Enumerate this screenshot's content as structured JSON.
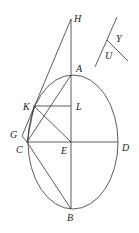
{
  "diagram": {
    "type": "geometry-ellipse-construction",
    "ellipse": {
      "cx": 73,
      "cy": 142,
      "rx": 45,
      "ry": 67
    },
    "points": {
      "H": {
        "x": 71,
        "y": 19,
        "lx": 74,
        "ly": 22,
        "label": "H"
      },
      "A": {
        "x": 71,
        "y": 75,
        "lx": 76,
        "ly": 72,
        "label": "A"
      },
      "K": {
        "x": 34,
        "y": 106,
        "lx": 23,
        "ly": 110,
        "label": "K"
      },
      "L": {
        "x": 71,
        "y": 106,
        "lx": 76,
        "ly": 110,
        "label": "L"
      },
      "G": {
        "x": 22,
        "y": 136,
        "lx": 10,
        "ly": 138,
        "label": "G"
      },
      "C": {
        "x": 27,
        "y": 142,
        "lx": 16,
        "ly": 153,
        "label": "C"
      },
      "E": {
        "x": 71,
        "y": 142,
        "lx": 61,
        "ly": 154,
        "label": "E"
      },
      "D": {
        "x": 118,
        "y": 142,
        "lx": 122,
        "ly": 151,
        "label": "D"
      },
      "B": {
        "x": 71,
        "y": 209,
        "lx": 67,
        "ly": 221,
        "label": "B"
      },
      "Y": {
        "lx": 116,
        "ly": 42,
        "label": "Y"
      },
      "U": {
        "lx": 105,
        "ly": 59,
        "label": "U"
      }
    },
    "segments": [
      [
        "H",
        "B"
      ],
      [
        "H",
        "G"
      ],
      [
        "G",
        "C"
      ],
      [
        "K",
        "C"
      ],
      [
        "A",
        "C"
      ],
      [
        "K",
        "L"
      ],
      [
        "K",
        "E"
      ],
      [
        "C",
        "D"
      ],
      [
        "C",
        "B"
      ]
    ],
    "angle_figure": {
      "line1": [
        117,
        17,
        95,
        67
      ],
      "line2": [
        107,
        40,
        128,
        61
      ]
    }
  }
}
